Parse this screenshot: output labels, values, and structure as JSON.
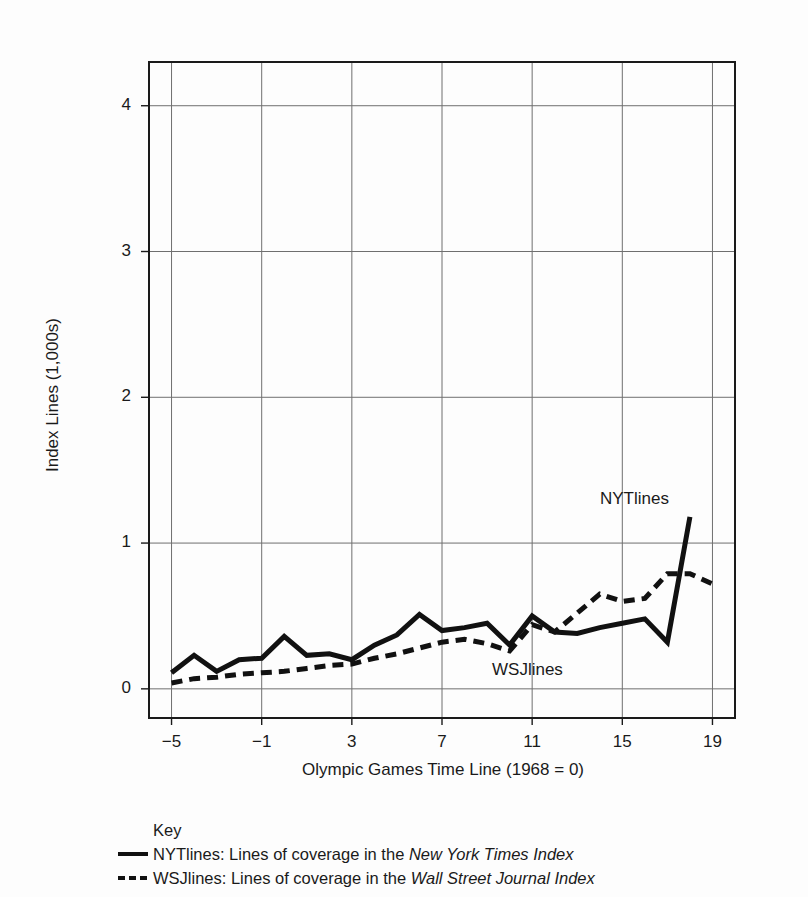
{
  "chart_data": {
    "type": "line",
    "title": "",
    "xlabel": "Olympic Games Time Line (1968 = 0)",
    "ylabel": "Index Lines (1,000s)",
    "xlim": [
      -6,
      20
    ],
    "ylim": [
      -0.2,
      4.3
    ],
    "xticks": [
      -5,
      -1,
      3,
      7,
      11,
      15,
      19
    ],
    "xtick_labels": [
      "−5",
      "−1",
      "3",
      "7",
      "11",
      "15",
      "19"
    ],
    "yticks": [
      0,
      1,
      2,
      3,
      4
    ],
    "ytick_labels": [
      "0",
      "1",
      "2",
      "3",
      "4"
    ],
    "grid": true,
    "legend_position": "below-plot",
    "x": [
      -5,
      -4,
      -3,
      -2,
      -1,
      0,
      1,
      2,
      3,
      4,
      5,
      6,
      7,
      8,
      9,
      10,
      11,
      12,
      13,
      14,
      15,
      16,
      17,
      18,
      19
    ],
    "series": [
      {
        "name": "NYTlines",
        "style": "solid",
        "color": "#111111",
        "annotation": "NYTlines",
        "values": [
          0.11,
          0.23,
          0.12,
          0.2,
          0.21,
          0.36,
          0.23,
          0.24,
          0.2,
          0.3,
          0.37,
          0.51,
          0.4,
          0.42,
          0.45,
          0.3,
          0.5,
          0.39,
          0.38,
          0.42,
          0.45,
          0.48,
          0.32,
          1.18,
          null
        ]
      },
      {
        "name": "WSJlines",
        "style": "dashed",
        "color": "#111111",
        "annotation": "WSJlines",
        "values": [
          0.04,
          0.07,
          0.08,
          0.1,
          0.11,
          0.12,
          0.14,
          0.16,
          0.17,
          0.21,
          0.24,
          0.28,
          0.32,
          0.34,
          0.31,
          0.26,
          0.44,
          0.39,
          0.52,
          0.65,
          0.6,
          0.62,
          0.79,
          0.79,
          0.72
        ]
      }
    ]
  },
  "key": {
    "title": "Key",
    "entries": [
      {
        "swatch": "solid",
        "prefix": "NYTlines: Lines of coverage in the ",
        "italic": "New York Times Index"
      },
      {
        "swatch": "dashed",
        "prefix": "WSJlines: Lines of coverage in the ",
        "italic": "Wall Street Journal Index"
      }
    ]
  }
}
